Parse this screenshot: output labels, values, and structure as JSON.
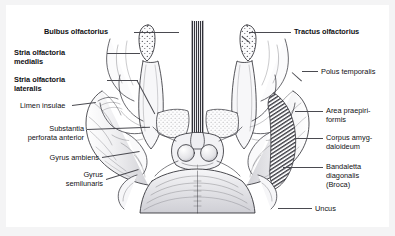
{
  "figure": {
    "background_color": "#f4f4f5",
    "plate_color": "#ffffff",
    "ink_color": "#111114",
    "leader_color": "#4a4a50"
  },
  "labels": {
    "bulbus_olfactorius": "Bulbus olfactorius",
    "tractus_olfactorius": "Tractus olfactorius",
    "stria_olfactoria_medialis": "Stria olfactoria\nmedialis",
    "stria_olfactoria_lateralis": "Stria olfactoria\nlateralis",
    "limen_insulae": "Limen insulae",
    "substantia_perforata_anterior": "Substantia\nperforata anterior",
    "gyrus_ambiens": "Gyrus ambiens",
    "gyrus_semilunaris": "Gyrus\nsemilunaris",
    "polus_temporalis": "Polus temporalis",
    "area_praepiriformis": "Area praepiri-\nformis",
    "corpus_amygdaloideum": "Corpus amyg-\ndaloideum",
    "bandaletta_diagonalis": "Bandaletta\ndiagonalis\n(Broca)",
    "uncus": "Uncus"
  }
}
